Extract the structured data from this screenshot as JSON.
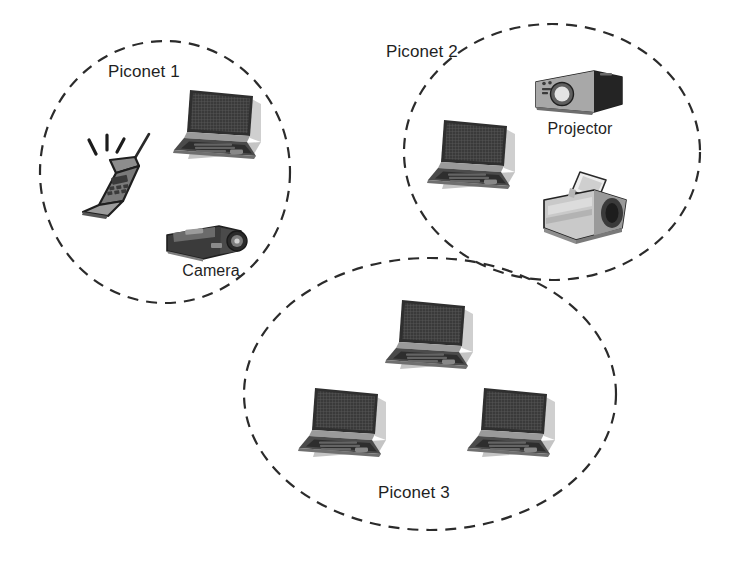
{
  "diagram": {
    "background_color": "#ffffff",
    "boundary_stroke_color": "#2b2b2b",
    "boundary_style": "dashed"
  },
  "piconets": [
    {
      "id": "piconet-1",
      "label": "Piconet 1",
      "label_x": 108,
      "label_y": 62,
      "ellipse": {
        "cx": 165,
        "cy": 172,
        "rx": 125,
        "ry": 131
      },
      "devices": [
        {
          "icon": "mobile-phone-icon",
          "name": "mobile-phone",
          "label": "",
          "x": 66,
          "y": 128,
          "w": 98,
          "h": 92
        },
        {
          "icon": "laptop-icon",
          "name": "laptop",
          "label": "",
          "x": 168,
          "y": 80,
          "w": 100,
          "h": 88
        },
        {
          "icon": "camera-icon",
          "name": "camera",
          "label": "Camera",
          "label_x": 163,
          "label_y": 262,
          "label_w": 96,
          "x": 163,
          "y": 215,
          "w": 92,
          "h": 48
        }
      ]
    },
    {
      "id": "piconet-2",
      "label": "Piconet 2",
      "label_x": 386,
      "label_y": 42,
      "ellipse": {
        "cx": 552,
        "cy": 152,
        "rx": 148,
        "ry": 128
      },
      "devices": [
        {
          "icon": "laptop-icon",
          "name": "laptop",
          "label": "",
          "x": 422,
          "y": 110,
          "w": 100,
          "h": 88
        },
        {
          "icon": "projector-icon",
          "name": "projector",
          "label": "Projector",
          "label_x": 528,
          "label_y": 120,
          "label_w": 104,
          "x": 528,
          "y": 66,
          "w": 100,
          "h": 54
        },
        {
          "icon": "printer-icon",
          "name": "printer",
          "label": "",
          "x": 536,
          "y": 166,
          "w": 98,
          "h": 82
        }
      ]
    },
    {
      "id": "piconet-3",
      "label": "Piconet 3",
      "label_x": 378,
      "label_y": 483,
      "ellipse": {
        "cx": 430,
        "cy": 394,
        "rx": 186,
        "ry": 136
      },
      "devices": [
        {
          "icon": "laptop-icon",
          "name": "laptop",
          "label": "",
          "x": 380,
          "y": 290,
          "w": 100,
          "h": 88
        },
        {
          "icon": "laptop-icon",
          "name": "laptop",
          "label": "",
          "x": 293,
          "y": 378,
          "w": 100,
          "h": 88
        },
        {
          "icon": "laptop-icon",
          "name": "laptop",
          "label": "",
          "x": 462,
          "y": 378,
          "w": 100,
          "h": 88
        }
      ]
    }
  ]
}
